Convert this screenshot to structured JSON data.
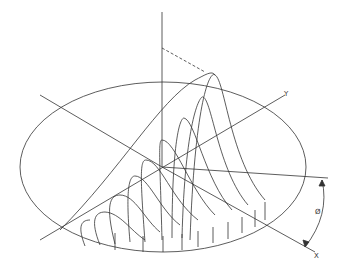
{
  "diagram": {
    "labels": {
      "y_axis": "Y",
      "x_axis": "X",
      "angle": "Ø"
    },
    "colors": {
      "line": "#222222",
      "background": "#ffffff"
    }
  }
}
